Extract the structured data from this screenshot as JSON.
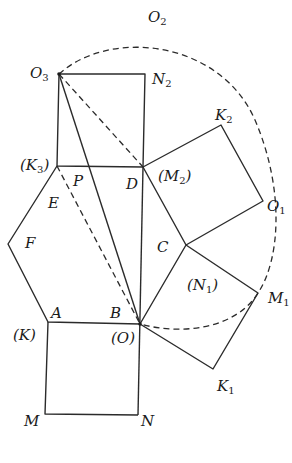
{
  "figure": {
    "points": {
      "O3": [
        59,
        74
      ],
      "N2": [
        145,
        74
      ],
      "K3": [
        57,
        166
      ],
      "P": [
        86,
        166
      ],
      "D": [
        143,
        167
      ],
      "K2": [
        221,
        125
      ],
      "O1": [
        263,
        201
      ],
      "C": [
        186,
        245
      ],
      "M1": [
        258,
        293
      ],
      "K1": [
        213,
        369
      ],
      "B": [
        140,
        324
      ],
      "A": [
        48,
        322
      ],
      "F": [
        8,
        244
      ],
      "M": [
        45,
        414
      ],
      "N": [
        138,
        415
      ]
    },
    "labels": [
      {
        "id": "O2",
        "text": "O",
        "sub": "2",
        "x": 148,
        "y": 22
      },
      {
        "id": "O3",
        "text": "O",
        "sub": "3",
        "x": 30,
        "y": 78
      },
      {
        "id": "N2",
        "text": "N",
        "sub": "2",
        "x": 152,
        "y": 84
      },
      {
        "id": "K2",
        "text": "K",
        "sub": "2",
        "x": 215,
        "y": 120
      },
      {
        "id": "K3",
        "text": "(K",
        "sub": "3",
        "after": ")",
        "x": 20,
        "y": 170
      },
      {
        "id": "P",
        "text": "P",
        "sub": "",
        "x": 73,
        "y": 186
      },
      {
        "id": "D",
        "text": "D",
        "sub": "",
        "x": 126,
        "y": 189
      },
      {
        "id": "M2",
        "text": "(M",
        "sub": "2",
        "after": ")",
        "x": 158,
        "y": 181
      },
      {
        "id": "E",
        "text": "E",
        "sub": "",
        "x": 48,
        "y": 208
      },
      {
        "id": "O1",
        "text": "O",
        "sub": "1",
        "x": 267,
        "y": 211
      },
      {
        "id": "F",
        "text": "F",
        "sub": "",
        "x": 25,
        "y": 248
      },
      {
        "id": "C",
        "text": "C",
        "sub": "",
        "x": 157,
        "y": 252
      },
      {
        "id": "N1",
        "text": "(N",
        "sub": "1",
        "after": ")",
        "x": 187,
        "y": 290
      },
      {
        "id": "M1",
        "text": "M",
        "sub": "1",
        "x": 268,
        "y": 303
      },
      {
        "id": "A",
        "text": "A",
        "sub": "",
        "x": 51,
        "y": 318
      },
      {
        "id": "B",
        "text": "B",
        "sub": "",
        "x": 110,
        "y": 318
      },
      {
        "id": "K",
        "text": "(K)",
        "sub": "",
        "x": 13,
        "y": 340
      },
      {
        "id": "O",
        "text": "(O)",
        "sub": "",
        "x": 111,
        "y": 343
      },
      {
        "id": "K1",
        "text": "K",
        "sub": "1",
        "x": 217,
        "y": 391
      },
      {
        "id": "M",
        "text": "M",
        "sub": "",
        "x": 24,
        "y": 426
      },
      {
        "id": "N",
        "text": "N",
        "sub": "",
        "x": 141,
        "y": 426
      }
    ],
    "colors": {
      "stroke": "#2b2b2b",
      "text": "#1a1a1a",
      "background": "#ffffff"
    }
  }
}
